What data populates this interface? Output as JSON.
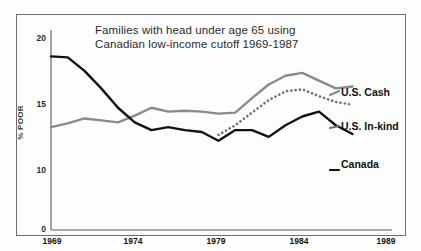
{
  "chart_data": {
    "type": "line",
    "title": "Families with head under age 65 using Canadian low-income cutoff 1969-1987",
    "title_line1": "Families with head under age 65 using",
    "title_line2": "Canadian low-income cutoff 1969-1987",
    "xlabel": "",
    "ylabel": "% POOR",
    "xlim": [
      1969,
      1989
    ],
    "ylim": [
      0,
      20
    ],
    "grid": false,
    "legend_position": "right-inline",
    "ytick_labels": [
      "0",
      "10",
      "15",
      "20"
    ],
    "yticks": [
      0,
      10,
      15,
      20
    ],
    "xtick_labels": [
      "1969",
      "1974",
      "1979",
      "1984",
      "1989"
    ],
    "xticks": [
      1969,
      1974,
      1979,
      1984,
      1989
    ],
    "x": [
      1969,
      1970,
      1971,
      1972,
      1973,
      1974,
      1975,
      1976,
      1977,
      1978,
      1979,
      1980,
      1981,
      1982,
      1983,
      1984,
      1985,
      1986,
      1987
    ],
    "series": [
      {
        "name": "U.S. Cash",
        "color": "#8a8a8a",
        "style": "solid",
        "label": "U.S. Cash",
        "x": [
          1969,
          1970,
          1971,
          1972,
          1973,
          1974,
          1975,
          1976,
          1977,
          1978,
          1979,
          1980,
          1981,
          1982,
          1983,
          1984,
          1985,
          1986,
          1987
        ],
        "values": [
          10.6,
          11.0,
          11.5,
          11.3,
          11.1,
          11.8,
          12.6,
          12.2,
          12.3,
          12.2,
          12.0,
          12.1,
          13.6,
          15.0,
          15.9,
          16.2,
          15.4,
          14.6,
          14.8
        ]
      },
      {
        "name": "U.S. In-kind",
        "color": "#6f6f6f",
        "style": "dotted",
        "label": "U.S. In-kind",
        "x": [
          1979,
          1980,
          1981,
          1982,
          1983,
          1984,
          1985,
          1986,
          1987
        ],
        "values": [
          9.8,
          10.8,
          12.1,
          13.4,
          14.3,
          14.5,
          13.8,
          13.2,
          12.9
        ]
      },
      {
        "name": "Canada",
        "color": "#111111",
        "style": "solid",
        "label": "Canada",
        "x": [
          1969,
          1970,
          1971,
          1972,
          1973,
          1974,
          1975,
          1976,
          1977,
          1978,
          1979,
          1980,
          1981,
          1982,
          1983,
          1984,
          1985,
          1986,
          1987
        ],
        "values": [
          17.9,
          17.8,
          16.4,
          14.6,
          12.6,
          11.1,
          10.3,
          10.6,
          10.3,
          10.1,
          9.2,
          10.3,
          10.3,
          9.6,
          10.8,
          11.7,
          12.2,
          10.8,
          9.9
        ]
      }
    ]
  },
  "labels": {
    "us_cash": "U.S. Cash",
    "us_inkind": "U.S. In-kind",
    "canada": "Canada"
  }
}
